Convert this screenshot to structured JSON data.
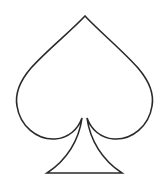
{
  "figure": {
    "symbol": "spade",
    "style": "outline",
    "stroke_color": "#2a2a2a",
    "fill_color": "#ffffff",
    "background": "#ffffff",
    "stroke_width": 1.6
  }
}
